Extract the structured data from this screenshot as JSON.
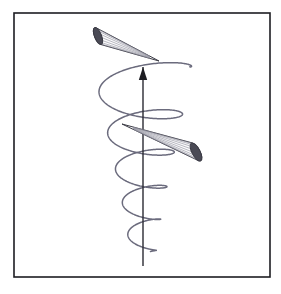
{
  "figure": {
    "title": "Conical helix with two emission cones around a vertical axis",
    "kind": "line-diagram",
    "canvas": {
      "width": 281,
      "height": 294,
      "background_color": "#ffffff"
    },
    "frame": {
      "name": "border-frame",
      "x": 14,
      "y": 13,
      "width": 256,
      "height": 264,
      "stroke_color": "#1d1d22",
      "stroke_width": 1.6,
      "fill_color": "#ffffff"
    },
    "axis": {
      "name": "vertical-axis-arrow",
      "label": "",
      "x": 143,
      "y_top": 67,
      "y_bottom": 266,
      "stroke_color": "#2a2a33",
      "stroke_width": 1.4,
      "arrowhead": {
        "tip_x": 143,
        "tip_y": 67,
        "half_width": 4.2,
        "length": 13,
        "fill_color": "#1d1d22"
      }
    },
    "helix": {
      "name": "conical-helix",
      "stroke_color": "#6b6b7d",
      "stroke_width": 1.5,
      "fill": "none",
      "center_x": 143,
      "description": "Conical spiral winding upward; loops widen from bottom to top",
      "turns": 5.2,
      "top_y": 62,
      "bottom_y": 255,
      "max_radius_x": 49,
      "min_radius_x": 13,
      "radius_y_ratio": 0.33,
      "loops": [
        {
          "index": 1,
          "center_y": 247,
          "radius_x": 14,
          "radius_y": 5
        },
        {
          "index": 2,
          "center_y": 220,
          "radius_x": 22,
          "radius_y": 7
        },
        {
          "index": 3,
          "center_y": 190,
          "radius_x": 31,
          "radius_y": 10
        },
        {
          "index": 4,
          "center_y": 156,
          "radius_x": 39,
          "radius_y": 13
        },
        {
          "index": 5,
          "center_y": 110,
          "radius_x": 48,
          "radius_y": 16
        }
      ]
    },
    "cones": [
      {
        "name": "upper-emission-cone",
        "apex_x": 159,
        "apex_y": 61,
        "base_center_x": 98,
        "base_center_y": 36,
        "base_radius_x": 3.5,
        "base_radius_y": 9,
        "base_rotation_deg": -22,
        "outline_color": "#3a3a44",
        "outline_width": 1.0,
        "base_fill_color": "#4a4a55",
        "body_fill_color": "#fbfbfc",
        "hatch_color": "#8b8b99",
        "hatch_count": 8
      },
      {
        "name": "lower-emission-cone",
        "apex_x": 122,
        "apex_y": 124,
        "base_center_x": 196,
        "base_center_y": 152,
        "base_radius_x": 4,
        "base_radius_y": 10,
        "base_rotation_deg": -28,
        "outline_color": "#3a3a44",
        "outline_width": 1.0,
        "base_fill_color": "#4a4a55",
        "body_fill_color": "#fbfbfc",
        "hatch_color": "#8b8b99",
        "hatch_count": 9
      }
    ],
    "colors": {
      "frame": "#1d1d22",
      "axis": "#2a2a33",
      "helix": "#6b6b7d",
      "cone_outline": "#3a3a44",
      "cone_base": "#4a4a55",
      "cone_hatch": "#8b8b99",
      "background": "#ffffff"
    },
    "labels": {
      "axis_label": "",
      "caption": "",
      "annotations": []
    }
  }
}
